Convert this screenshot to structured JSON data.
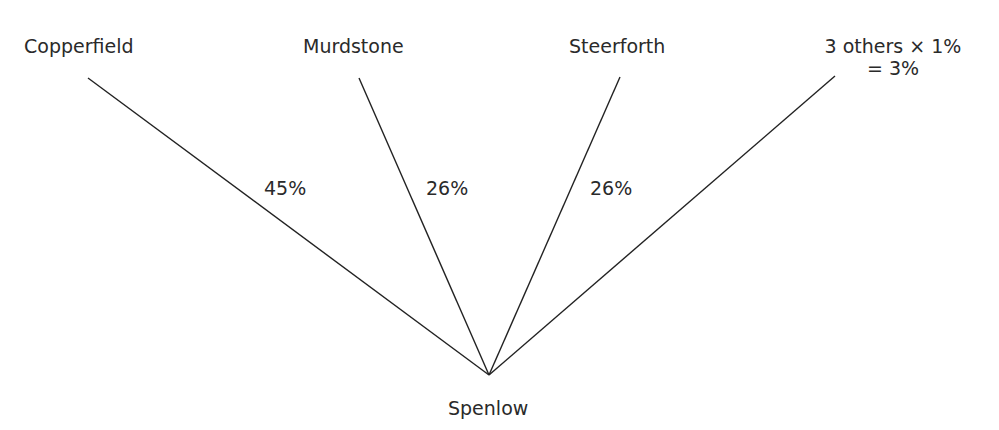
{
  "diagram": {
    "root": {
      "label": "Spenlow",
      "x": 489,
      "y": 375
    },
    "branches": [
      {
        "label": "Copperfield",
        "percent": "45%",
        "x": 88,
        "y": 78
      },
      {
        "label": "Murdstone",
        "percent": "26%",
        "x": 359,
        "y": 78
      },
      {
        "label": "Steerforth",
        "percent": "26%",
        "x": 620,
        "y": 77
      },
      {
        "label": "3 others × 1%",
        "label_line2": "= 3%",
        "x": 835,
        "y": 76
      }
    ],
    "line_color": "#222222",
    "text_color": "#2a2a2a"
  }
}
